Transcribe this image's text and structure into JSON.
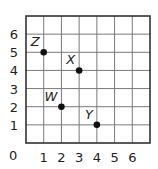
{
  "chart_data": {
    "type": "scatter",
    "title": "",
    "xlabel": "",
    "ylabel": "",
    "xlim": [
      0,
      7
    ],
    "ylim": [
      0,
      7
    ],
    "grid": true,
    "origin_label": "0",
    "x_ticks": [
      "1",
      "2",
      "3",
      "4",
      "5",
      "6"
    ],
    "y_ticks": [
      "1",
      "2",
      "3",
      "4",
      "5",
      "6"
    ],
    "points": [
      {
        "label": "Z",
        "x": 1,
        "y": 5
      },
      {
        "label": "X",
        "x": 3,
        "y": 4
      },
      {
        "label": "W",
        "x": 2,
        "y": 2
      },
      {
        "label": "Y",
        "x": 4,
        "y": 1
      }
    ]
  },
  "colors": {
    "grid": "#7a7a7a",
    "frame": "#333333",
    "point": "#111111",
    "text": "#222222"
  }
}
